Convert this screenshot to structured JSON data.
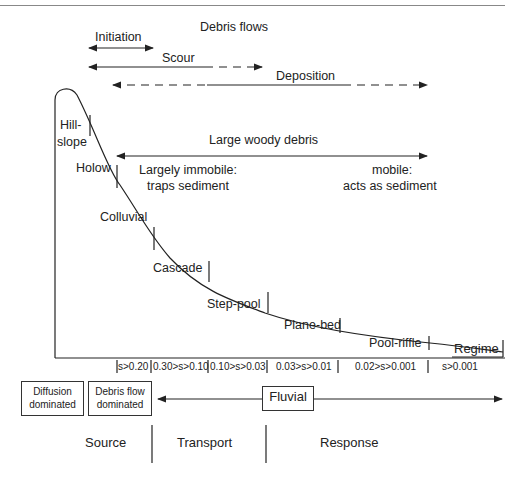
{
  "title": "Debris flows",
  "processes": {
    "initiation": "Initiation",
    "scour": "Scour",
    "deposition": "Deposition"
  },
  "channel_types": [
    {
      "label_line1": "Hill-",
      "label_line2": "slope"
    },
    {
      "label": "Holow"
    },
    {
      "label": "Colluvial"
    },
    {
      "label": "Cascade"
    },
    {
      "label": "Step-pool"
    },
    {
      "label": "Plane-bed"
    },
    {
      "label": "Pool-riffle"
    },
    {
      "label": "Regime"
    }
  ],
  "woody_debris": {
    "title": "Large woody debris",
    "left_line1": "Largely immobile:",
    "left_line2": "traps sediment",
    "right_line1": "mobile:",
    "right_line2": "acts as sediment"
  },
  "slopes": [
    "s>0.20",
    "0.30>s>0.10",
    "0.10>s>0.03",
    "0.03>s>0.01",
    "0.02>s>0.001",
    "s>0.001"
  ],
  "process_domains": {
    "diffusion_line1": "Diffusion",
    "diffusion_line2": "dominated",
    "debris_line1": "Debris flow",
    "debris_line2": "dominated",
    "fluvial": "Fluvial"
  },
  "zones": [
    "Source",
    "Transport",
    "Response"
  ]
}
